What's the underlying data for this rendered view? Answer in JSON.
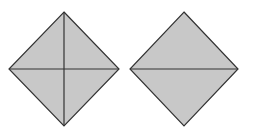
{
  "figure": {
    "fill_color": "#c8c8c8",
    "stroke_color": "#333333",
    "shapes": [
      {
        "name": "diamond-four-parts",
        "vertices": {
          "top": [
            64,
            12
          ],
          "right": [
            119,
            69
          ],
          "bottom": [
            64,
            126
          ],
          "left": [
            9,
            69
          ]
        },
        "divisions": [
          "horizontal-diagonal",
          "vertical-diagonal"
        ],
        "parts": 4
      },
      {
        "name": "diamond-two-parts",
        "vertices": {
          "top": [
            184,
            12
          ],
          "right": [
            238,
            69
          ],
          "bottom": [
            184,
            126
          ],
          "left": [
            130,
            69
          ]
        },
        "divisions": [
          "horizontal-diagonal"
        ],
        "parts": 2
      }
    ]
  }
}
